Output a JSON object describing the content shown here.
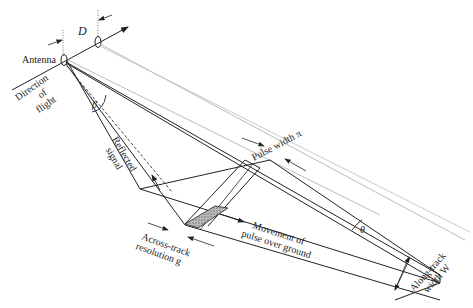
{
  "diagram": {
    "labels": {
      "D": "D",
      "antenna": "Antenna",
      "direction_line1": "Direction",
      "direction_line2": "of",
      "direction_line3": "flight",
      "beta": "β",
      "reflected_line1": "Reflected",
      "reflected_line2": "signal",
      "pulse_width": "Pulse width π",
      "theta": "θ",
      "across_line1": "Across-track",
      "across_line2": "resolution g",
      "movement_line1": "Movement of",
      "movement_line2": "pulse over ground",
      "along_line1": "Along-track",
      "along_line2": "width W"
    },
    "colors": {
      "line": "#222222",
      "light_line": "#aaaaaa",
      "shade": "#999999"
    }
  }
}
